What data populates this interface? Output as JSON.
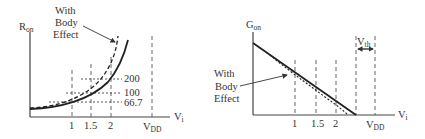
{
  "left_plot": {
    "y_axis_label": "R",
    "y_axis_label_sub": "on",
    "x_axis_label": "V",
    "x_axis_label_sub": "i",
    "x_ticks": [
      "1",
      "1.5",
      "2"
    ],
    "vdd_label": "V",
    "vdd_label_sub": "DD",
    "y_levels": [
      "200",
      "100",
      "66.7"
    ],
    "annotation_lines": [
      "With",
      "Body",
      "Effect"
    ]
  },
  "right_plot": {
    "y_axis_label": "G",
    "y_axis_label_sub": "on",
    "x_axis_label": "V",
    "x_axis_label_sub": "i",
    "x_ticks": [
      "1",
      "1.5",
      "2"
    ],
    "vdd_label": "V",
    "vdd_label_sub": "DD",
    "vth_label": "V",
    "vth_label_sub": "th",
    "annotation_lines": [
      "With",
      "Body",
      "Effect"
    ]
  }
}
